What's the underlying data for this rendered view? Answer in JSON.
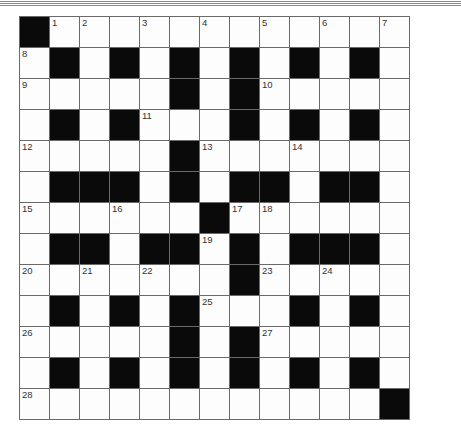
{
  "puzzle": {
    "rows": 13,
    "cols": 13,
    "grid": [
      [
        "#",
        "1",
        "2",
        "",
        "3",
        "",
        "4",
        "",
        "5",
        "",
        "6",
        "",
        "7"
      ],
      [
        "8",
        "#",
        "",
        "#",
        "",
        "#",
        "",
        "#",
        "",
        "#",
        "",
        "#",
        ""
      ],
      [
        "9",
        "",
        "",
        "",
        "",
        "#",
        "",
        "#",
        "10",
        "",
        "",
        "",
        ""
      ],
      [
        "",
        "#",
        "",
        "#",
        "11",
        "",
        "",
        "#",
        "",
        "#",
        "",
        "#",
        ""
      ],
      [
        "12",
        "",
        "",
        "",
        "",
        "#",
        "13",
        "",
        "",
        "14",
        "",
        "",
        ""
      ],
      [
        "",
        "#",
        "#",
        "#",
        "",
        "#",
        "",
        "#",
        "#",
        "",
        "#",
        "#",
        ""
      ],
      [
        "15",
        "",
        "",
        "16",
        "",
        "",
        "#",
        "17",
        "18",
        "",
        "",
        "",
        ""
      ],
      [
        "",
        "#",
        "#",
        "",
        "#",
        "#",
        "19",
        "#",
        "",
        "#",
        "#",
        "#",
        ""
      ],
      [
        "20",
        "",
        "21",
        "",
        "22",
        "",
        "",
        "#",
        "23",
        "",
        "24",
        "",
        ""
      ],
      [
        "",
        "#",
        "",
        "#",
        "",
        "#",
        "25",
        "",
        "",
        "#",
        "",
        "#",
        ""
      ],
      [
        "26",
        "",
        "",
        "",
        "",
        "#",
        "",
        "#",
        "27",
        "",
        "",
        "",
        ""
      ],
      [
        "",
        "#",
        "",
        "#",
        "",
        "#",
        "",
        "#",
        "",
        "#",
        "",
        "#",
        ""
      ],
      [
        "28",
        "",
        "",
        "",
        "",
        "",
        "",
        "",
        "",
        "",
        "",
        "",
        "#"
      ]
    ]
  },
  "colors": {
    "black_square": "#0a0a0a",
    "white_square": "#fdfdfd",
    "grid_line": "#6a6a6a"
  }
}
